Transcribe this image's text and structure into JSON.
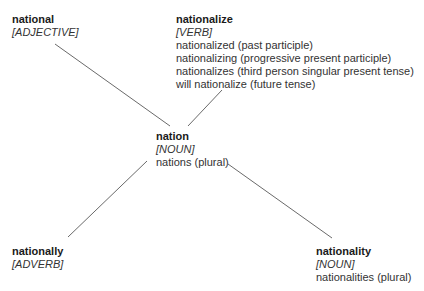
{
  "center": {
    "word": "nation",
    "pos": "[NOUN]",
    "forms": [
      "nations (plural)"
    ]
  },
  "nodes": [
    {
      "id": "national",
      "word": "national",
      "pos": "[ADJECTIVE]",
      "forms": []
    },
    {
      "id": "nationalize",
      "word": "nationalize",
      "pos": "[VERB]",
      "forms": [
        "nationalized (past participle)",
        "nationalizing (progressive present participle)",
        "nationalizes (third person singular present tense)",
        "will nationalize (future tense)"
      ]
    },
    {
      "id": "nationally",
      "word": "nationally",
      "pos": "[ADVERB]",
      "forms": []
    },
    {
      "id": "nationality",
      "word": "nationality",
      "pos": "[NOUN]",
      "forms": [
        "nationalities (plural)"
      ]
    }
  ],
  "edges": [
    {
      "from": "nation",
      "to": "national"
    },
    {
      "from": "nation",
      "to": "nationalize"
    },
    {
      "from": "nation",
      "to": "nationally"
    },
    {
      "from": "nation",
      "to": "nationality"
    }
  ],
  "colors": {
    "line": "#6a6a6a",
    "text": "#2a2a2a",
    "background": "#ffffff"
  }
}
